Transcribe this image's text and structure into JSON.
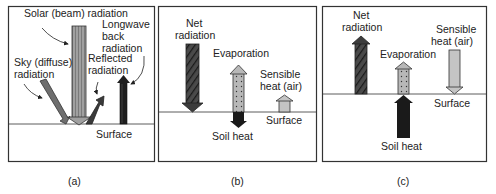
{
  "figure": {
    "panels": [
      {
        "id": "a",
        "caption": "(a)",
        "labels": {
          "solar": "Solar (beam) radiation",
          "longwave_1": "Longwave",
          "longwave_2": "back",
          "longwave_3": "radiation",
          "sky_1": "Sky (diffuse)",
          "sky_2": "radiation",
          "reflected_1": "Reflected",
          "reflected_2": "radiation",
          "surface": "Surface"
        }
      },
      {
        "id": "b",
        "caption": "(b)",
        "labels": {
          "net_1": "Net",
          "net_2": "radiation",
          "evaporation": "Evaporation",
          "sensible_1": "Sensible",
          "sensible_2": "heat (air)",
          "surface": "Surface",
          "soil": "Soil heat"
        }
      },
      {
        "id": "c",
        "caption": "(c)",
        "labels": {
          "net_1": "Net",
          "net_2": "radiation",
          "evaporation": "Evaporation",
          "sensible_1": "Sensible",
          "sensible_2": "heat (air)",
          "surface": "Surface",
          "soil": "Soil heat"
        }
      }
    ],
    "colors": {
      "border": "#333333",
      "solar": "#9a9a9a",
      "sky": "#6e6e6e",
      "reflected": "#3a3a3a",
      "longwave": "#1e1e1e",
      "net": "#3c3c3c",
      "evaporation": "#b8b8b8",
      "sensible": "#c4c4c4",
      "soil": "#1a1a1a"
    }
  }
}
